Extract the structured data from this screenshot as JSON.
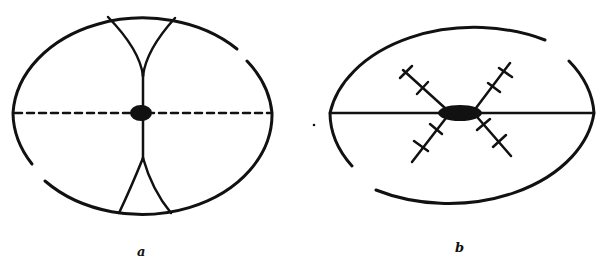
{
  "figure": {
    "panels": [
      {
        "id": "a",
        "label": "a",
        "description": "Oval cell with dashed equatorial line, central dark body, and two pairs of curved lines converging at the center from top and bottom poles"
      },
      {
        "id": "b",
        "label": "b",
        "description": "Oval cell with solid equatorial line, central dark body, and four radiating lines with cross-bars forming an X"
      }
    ],
    "colors": {
      "ink": "#111111",
      "background": "#ffffff"
    }
  }
}
